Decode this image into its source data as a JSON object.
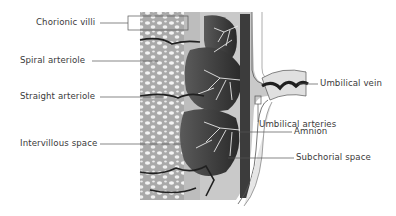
{
  "diagram": {
    "type": "anatomical-cross-section",
    "labels": {
      "chorionic_villi": "Chorionic villi",
      "spiral_arteriole": "Spiral arteriole",
      "straight_arteriole": "Straight arteriole",
      "intervillous_space": "Intervillous space",
      "umbilical_vein": "Umbilical vein",
      "umbilical_arteries": "Umbilical arteries",
      "amnion": "Amnion",
      "subchorial_space": "Subchorial space"
    },
    "colors": {
      "label_text": "#3a3a3a",
      "leader_line": "#555555",
      "tissue_light": "#d2d2d2",
      "tissue_mid": "#9a9a9a",
      "tissue_dark": "#2e2e2e",
      "membrane": "#e6e6e6"
    }
  }
}
